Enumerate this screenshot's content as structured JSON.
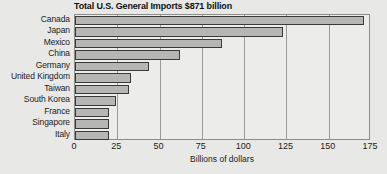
{
  "chart_data": {
    "type": "bar",
    "orientation": "horizontal",
    "title": "Total U.S. General Imports $871 billion",
    "xlabel": "Billions of dollars",
    "ylabel": "",
    "xlim": [
      0,
      175
    ],
    "xticks": [
      0,
      25,
      50,
      75,
      100,
      125,
      150,
      175
    ],
    "xtick_labels": [
      "0",
      "25",
      "50",
      "75",
      "100",
      "125",
      "150",
      "175"
    ],
    "grid": true,
    "grid_axis": "x",
    "legend": false,
    "categories": [
      "Canada",
      "Japan",
      "Mexico",
      "China",
      "Germany",
      "United Kingdom",
      "Taiwan",
      "South Korea",
      "France",
      "Singapore",
      "Italy"
    ],
    "values": [
      171,
      123,
      87,
      62,
      44,
      33,
      32,
      24,
      20,
      20,
      20
    ],
    "units": "billions of dollars"
  },
  "style": {
    "background": "#e8e8e6",
    "plot_background": "#ececeb",
    "bar_fill": "#b6b6b4",
    "bar_border": "#3a3a38",
    "grid_color": "#9a9a97",
    "text_color": "#1b1b1b"
  }
}
